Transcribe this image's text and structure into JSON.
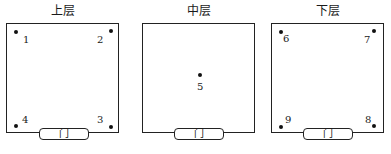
{
  "panels": [
    {
      "title": "上层",
      "door": "门",
      "points": [
        {
          "label": "1"
        },
        {
          "label": "2"
        },
        {
          "label": "3"
        },
        {
          "label": "4"
        }
      ]
    },
    {
      "title": "中层",
      "door": "门",
      "points": [
        {
          "label": "5"
        }
      ]
    },
    {
      "title": "下层",
      "door": "门",
      "points": [
        {
          "label": "6"
        },
        {
          "label": "7"
        },
        {
          "label": "8"
        },
        {
          "label": "9"
        }
      ]
    }
  ]
}
